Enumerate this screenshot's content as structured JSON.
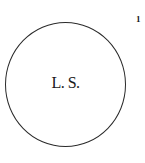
{
  "seal": {
    "label": "L. S."
  },
  "page": {
    "marker": "1"
  }
}
